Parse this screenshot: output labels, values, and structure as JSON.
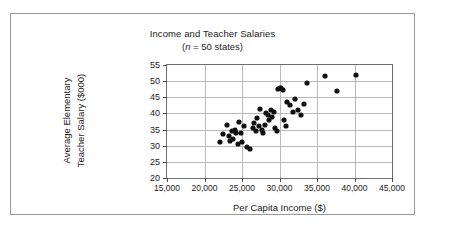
{
  "chart_data": {
    "type": "scatter",
    "title": "Income and Teacher Salaries",
    "subtitle_prefix": "(",
    "subtitle_n": "n",
    "subtitle_rest": " = 50 states)",
    "xlabel": "Per Capita Income ($)",
    "ylabel_line1": "Average Elementary",
    "ylabel_line2": "Teacher Salary ($000)",
    "xlim": [
      15000,
      45000
    ],
    "ylim": [
      20,
      55
    ],
    "xticks": [
      15000,
      20000,
      25000,
      30000,
      35000,
      40000,
      45000
    ],
    "xtick_labels": [
      "15,000",
      "20,000",
      "25,000",
      "30,000",
      "35,000",
      "40,000",
      "45,000"
    ],
    "yticks": [
      20,
      25,
      30,
      35,
      40,
      45,
      50,
      55
    ],
    "ytick_labels": [
      "20",
      "25",
      "30",
      "35",
      "40",
      "45",
      "50",
      "55"
    ],
    "grid": true,
    "legend": false,
    "marker_color": "#111111",
    "points": [
      {
        "x": 22000,
        "y": 31.0
      },
      {
        "x": 22400,
        "y": 33.5
      },
      {
        "x": 23000,
        "y": 36.5
      },
      {
        "x": 23200,
        "y": 33.0
      },
      {
        "x": 23400,
        "y": 31.5
      },
      {
        "x": 23600,
        "y": 34.5
      },
      {
        "x": 23800,
        "y": 32.0
      },
      {
        "x": 24000,
        "y": 35.0
      },
      {
        "x": 24200,
        "y": 33.8
      },
      {
        "x": 24400,
        "y": 30.5
      },
      {
        "x": 24600,
        "y": 37.5
      },
      {
        "x": 24800,
        "y": 34.0
      },
      {
        "x": 25000,
        "y": 31.0
      },
      {
        "x": 25200,
        "y": 36.0
      },
      {
        "x": 25600,
        "y": 29.5
      },
      {
        "x": 26000,
        "y": 29.0
      },
      {
        "x": 26400,
        "y": 35.5
      },
      {
        "x": 26600,
        "y": 37.0
      },
      {
        "x": 26800,
        "y": 34.5
      },
      {
        "x": 27000,
        "y": 38.5
      },
      {
        "x": 27200,
        "y": 36.0
      },
      {
        "x": 27400,
        "y": 41.5
      },
      {
        "x": 27600,
        "y": 35.0
      },
      {
        "x": 27800,
        "y": 34.0
      },
      {
        "x": 28000,
        "y": 36.5
      },
      {
        "x": 28200,
        "y": 40.0
      },
      {
        "x": 28400,
        "y": 39.5
      },
      {
        "x": 28600,
        "y": 38.0
      },
      {
        "x": 28800,
        "y": 41.0
      },
      {
        "x": 29000,
        "y": 39.0
      },
      {
        "x": 29200,
        "y": 40.5
      },
      {
        "x": 29400,
        "y": 35.5
      },
      {
        "x": 29600,
        "y": 34.5
      },
      {
        "x": 29800,
        "y": 47.5
      },
      {
        "x": 30000,
        "y": 47.8
      },
      {
        "x": 30200,
        "y": 48.0
      },
      {
        "x": 30400,
        "y": 47.2
      },
      {
        "x": 30600,
        "y": 38.0
      },
      {
        "x": 30800,
        "y": 36.0
      },
      {
        "x": 31000,
        "y": 43.5
      },
      {
        "x": 31400,
        "y": 42.5
      },
      {
        "x": 31800,
        "y": 40.5
      },
      {
        "x": 32000,
        "y": 44.5
      },
      {
        "x": 32400,
        "y": 41.0
      },
      {
        "x": 32800,
        "y": 39.5
      },
      {
        "x": 33200,
        "y": 43.0
      },
      {
        "x": 33600,
        "y": 49.5
      },
      {
        "x": 36000,
        "y": 51.5
      },
      {
        "x": 37600,
        "y": 47.0
      },
      {
        "x": 40200,
        "y": 51.8
      }
    ]
  }
}
